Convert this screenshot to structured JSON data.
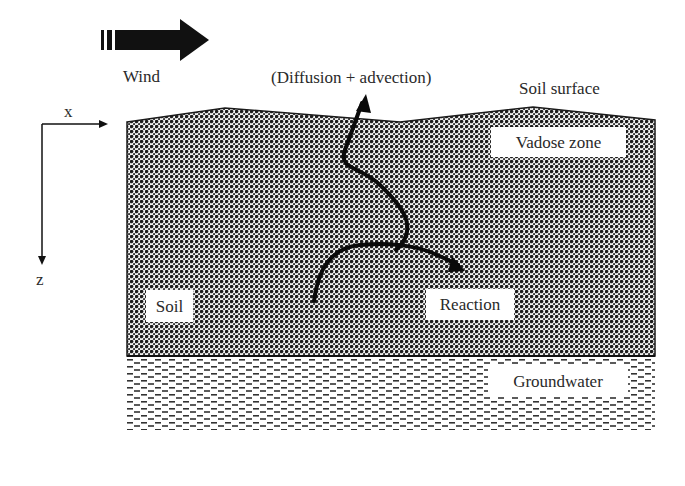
{
  "diagram": {
    "type": "soil cross-section schematic",
    "wind": {
      "label": "Wind",
      "icon": "wind-arrow-icon",
      "direction": "right"
    },
    "transport": {
      "label": "(Diffusion + advection)"
    },
    "surface": {
      "label": "Soil surface"
    },
    "axes": {
      "x_label": "x",
      "z_label": "z"
    },
    "layers": [
      {
        "name": "Vadose zone",
        "label": "Vadose zone",
        "pattern": "dense dotted"
      },
      {
        "name": "Soil",
        "label": "Soil",
        "pattern": "dense dotted"
      },
      {
        "name": "Groundwater",
        "label": "Groundwater",
        "pattern": "dashed"
      }
    ],
    "process": {
      "label": "Reaction"
    },
    "colors": {
      "soil_dark": "#1e1e1e",
      "soil_light": "#f0f0f0",
      "water_dash": "#333333",
      "background": "#ffffff"
    }
  }
}
